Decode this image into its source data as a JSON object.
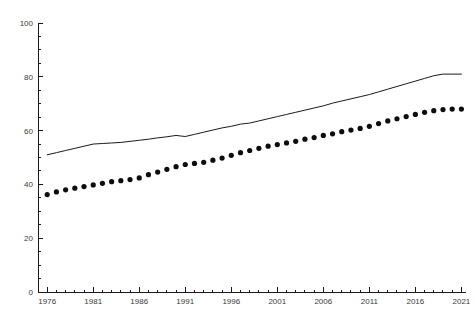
{
  "chart_data": {
    "type": "line",
    "title": "",
    "subtitle": "",
    "xlabel": "",
    "ylabel": "",
    "xlim": [
      1975,
      2021.5
    ],
    "ylim": [
      0,
      100
    ],
    "grid": false,
    "legend": "none",
    "x_tick_labels": [
      "1976",
      "1981",
      "1986",
      "1991",
      "1996",
      "2001",
      "2006",
      "2011",
      "2016",
      "2021"
    ],
    "x_ticks": [
      1976,
      1981,
      1986,
      1991,
      1996,
      2001,
      2006,
      2011,
      2016,
      2021
    ],
    "x_minor_step": 1,
    "y_tick_labels": [
      "0",
      "20",
      "40",
      "60",
      "80",
      "100"
    ],
    "y_ticks": [
      0,
      20,
      40,
      60,
      80,
      100
    ],
    "y_minor_step": 5,
    "x": [
      1976,
      1977,
      1978,
      1979,
      1980,
      1981,
      1982,
      1983,
      1984,
      1985,
      1986,
      1987,
      1988,
      1989,
      1990,
      1991,
      1992,
      1993,
      1994,
      1995,
      1996,
      1997,
      1998,
      1999,
      2000,
      2001,
      2002,
      2003,
      2004,
      2005,
      2006,
      2007,
      2008,
      2009,
      2010,
      2011,
      2012,
      2013,
      2014,
      2015,
      2016,
      2017,
      2018,
      2019,
      2020,
      2021
    ],
    "series": [
      {
        "name": "upper-line-series",
        "style": "solid-line",
        "color": "#1a1a1a",
        "values": [
          51.0,
          51.8,
          52.6,
          53.4,
          54.2,
          55.0,
          55.2,
          55.4,
          55.6,
          56.0,
          56.4,
          56.8,
          57.3,
          57.7,
          58.2,
          57.8,
          58.6,
          59.4,
          60.2,
          61.0,
          61.6,
          62.4,
          62.8,
          63.6,
          64.4,
          65.2,
          66.0,
          66.8,
          67.6,
          68.4,
          69.2,
          70.2,
          71.0,
          71.8,
          72.6,
          73.4,
          74.4,
          75.4,
          76.4,
          77.4,
          78.4,
          79.4,
          80.4,
          81.0,
          81.0,
          81.0
        ]
      },
      {
        "name": "lower-dotted-series",
        "style": "dotted-markers",
        "color": "#0d0d0d",
        "values": [
          36.2,
          37.2,
          38.0,
          38.6,
          39.2,
          39.8,
          40.4,
          41.0,
          41.4,
          41.8,
          42.4,
          43.6,
          44.6,
          45.6,
          46.6,
          47.4,
          47.8,
          48.2,
          49.0,
          49.8,
          50.8,
          51.8,
          52.6,
          53.4,
          54.2,
          54.8,
          55.4,
          56.0,
          56.8,
          57.4,
          58.2,
          58.8,
          59.6,
          60.2,
          60.8,
          61.6,
          62.6,
          63.6,
          64.4,
          65.2,
          66.0,
          66.8,
          67.4,
          67.8,
          68.0,
          68.0
        ]
      }
    ]
  }
}
